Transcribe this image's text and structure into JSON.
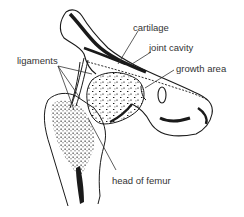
{
  "diagram": {
    "labels": [
      {
        "id": "cartilage",
        "text": "cartilage",
        "x": 133,
        "y": 23
      },
      {
        "id": "joint-cavity",
        "text": "joint cavity",
        "x": 149,
        "y": 43
      },
      {
        "id": "growth-area",
        "text": "growth area",
        "x": 176,
        "y": 64
      },
      {
        "id": "ligaments",
        "text": "ligaments",
        "x": 17,
        "y": 56
      },
      {
        "id": "head-of-femur",
        "text": "head of femur",
        "x": 112,
        "y": 176
      }
    ],
    "colors": {
      "ink": "#1a1a1a",
      "text": "#333333",
      "background": "#ffffff"
    }
  }
}
